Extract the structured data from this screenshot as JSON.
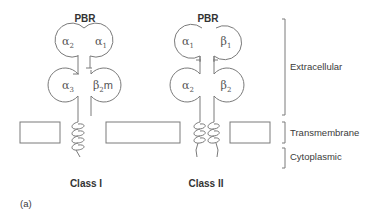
{
  "diagram": {
    "panel_label": "(a)",
    "colors": {
      "line": "#7a7a7a",
      "text": "#3a3a3a",
      "background": "#ffffff"
    },
    "regions": [
      {
        "label": "Extracellular"
      },
      {
        "label": "Transmembrane"
      },
      {
        "label": "Cytoplasmic"
      }
    ],
    "class_i": {
      "title": "Class I",
      "groove_label": "PBR",
      "domains": [
        {
          "base": "α",
          "sub": "2",
          "suffix": ""
        },
        {
          "base": "α",
          "sub": "1",
          "suffix": ""
        },
        {
          "base": "α",
          "sub": "3",
          "suffix": ""
        },
        {
          "base": "β",
          "sub": "2",
          "suffix": "m"
        }
      ]
    },
    "class_ii": {
      "title": "Class II",
      "groove_label": "PBR",
      "domains": [
        {
          "base": "α",
          "sub": "1",
          "suffix": ""
        },
        {
          "base": "β",
          "sub": "1",
          "suffix": ""
        },
        {
          "base": "α",
          "sub": "2",
          "suffix": ""
        },
        {
          "base": "β",
          "sub": "2",
          "suffix": ""
        }
      ]
    }
  }
}
